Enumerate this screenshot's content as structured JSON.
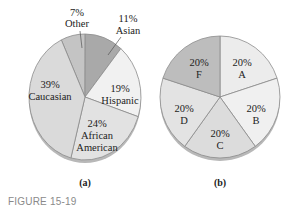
{
  "figure_label": "FIGURE 15-19",
  "chart_data": [
    {
      "type": "pie",
      "caption": "(a)",
      "categories": [
        "Other",
        "Asian",
        "Hispanic",
        "African American",
        "Caucasian"
      ],
      "values": [
        7,
        11,
        19,
        24,
        39
      ],
      "labels": [
        "7%",
        "11%",
        "19%",
        "24%",
        "39%"
      ],
      "colors": [
        "#c4c4c4",
        "#a9a9a9",
        "#f1f1f1",
        "#e2e2e2",
        "#dadada"
      ]
    },
    {
      "type": "pie",
      "caption": "(b)",
      "categories": [
        "A",
        "B",
        "C",
        "D",
        "F"
      ],
      "values": [
        20,
        20,
        20,
        20,
        20
      ],
      "labels": [
        "20%",
        "20%",
        "20%",
        "20%",
        "20%"
      ],
      "colors": [
        "#ececec",
        "#f0f0f0",
        "#dcdcdc",
        "#e3e3e3",
        "#bdbdbd"
      ]
    }
  ]
}
